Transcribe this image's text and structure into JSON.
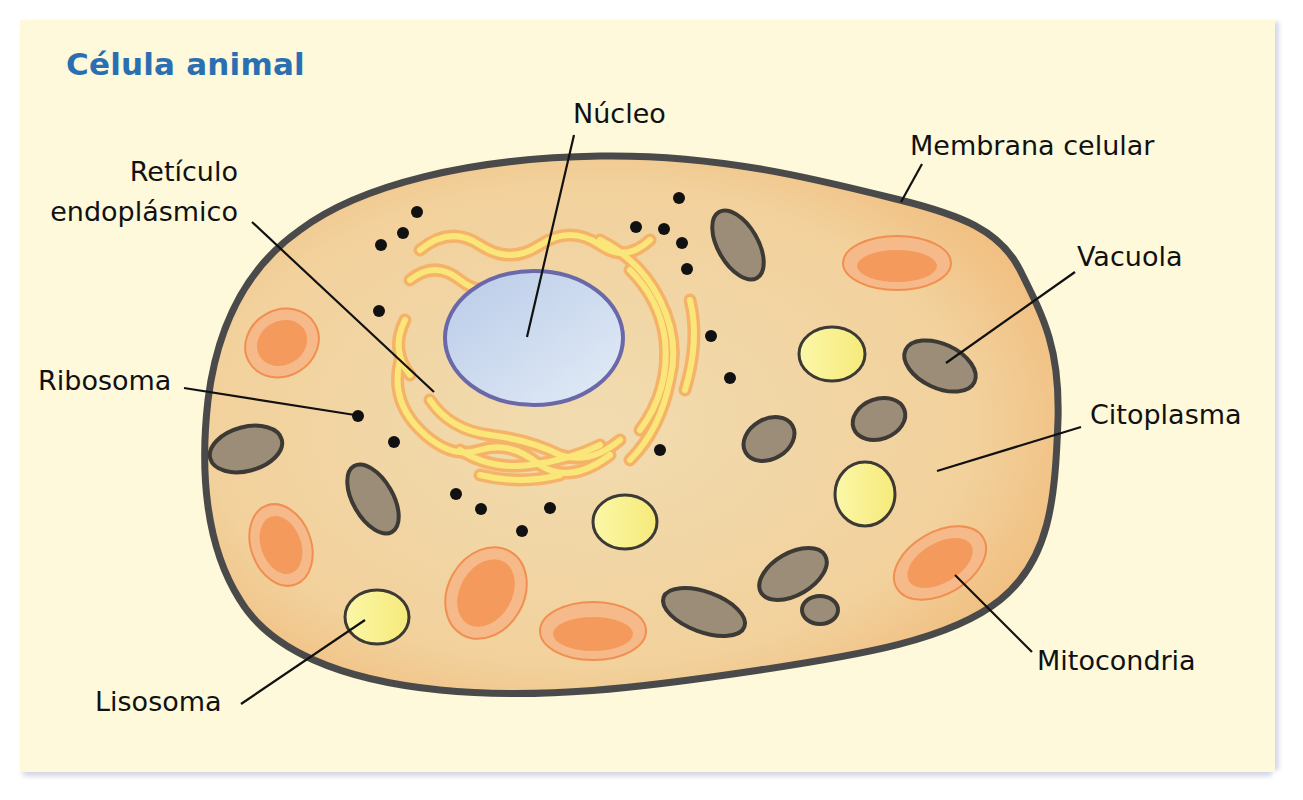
{
  "title": "Célula animal",
  "labels": {
    "nucleus": "Núcleo",
    "membrane": "Membrana celular",
    "er_line1": "Retículo",
    "er_line2": "endoplásmico",
    "vacuole": "Vacuola",
    "ribosome": "Ribosoma",
    "cytoplasm": "Citoplasma",
    "mitochondria": "Mitocondria",
    "lysosome": "Lisosoma"
  },
  "colors": {
    "background": "#fdf9da",
    "title": "#2b6fb3",
    "cytoplasm": "#f3d4a0",
    "membrane": "#4a4a4a",
    "nucleus": "#c8d8ee",
    "nucleus_border": "#6a68a8",
    "er": "#fbe67a",
    "er_border": "#f5b36a",
    "mitochondria": "#f49a5c",
    "vacuole": "#9b8d78",
    "lysosome": "#f8f08a"
  }
}
